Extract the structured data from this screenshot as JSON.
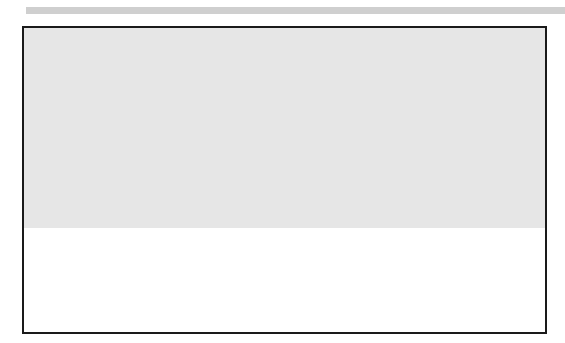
{
  "diagram": {
    "colors": {
      "background": "#ffffff",
      "top_bar": "#cfcfcf",
      "upper_fabric": "#e6e6e6",
      "lower_fabric": "#b4b4b4",
      "line": "#1a1a1a"
    },
    "frame": {
      "x": 23,
      "y": 27,
      "width": 523,
      "height": 306
    },
    "seams": [
      {
        "dashed_x": 174,
        "solid_x": 179
      },
      {
        "dashed_x": 267,
        "solid_x": 271
      },
      {
        "dashed_x": 352,
        "solid_x": 356
      }
    ],
    "panels": [
      {
        "x0": 25,
        "x1": 179,
        "edge_y0": 236,
        "edge_y1": 224,
        "hem_y": 307
      },
      {
        "x0": 179,
        "x1": 271,
        "edge_y0": 233,
        "edge_y1": 224,
        "hem_y": 304
      },
      {
        "x0": 271,
        "x1": 356,
        "edge_y0": 231,
        "edge_y1": 219,
        "hem_y": 300
      },
      {
        "x0": 356,
        "x1": 544,
        "edge_y0": 231,
        "edge_y1": 226,
        "hem_y": 304
      }
    ],
    "tick_marks": [
      {
        "x": 143,
        "y0": 251,
        "y1": 266
      },
      {
        "x": 164,
        "y0": 250,
        "y1": 264
      },
      {
        "x": 238,
        "y0": 250,
        "y1": 264
      },
      {
        "x": 257,
        "y0": 249,
        "y1": 263
      },
      {
        "x": 323,
        "y0": 247,
        "y1": 261
      },
      {
        "x": 340,
        "y0": 246,
        "y1": 260
      }
    ],
    "thread_tails": [
      {
        "x": 174,
        "y": 303
      },
      {
        "x": 268,
        "y": 300
      },
      {
        "x": 352,
        "y": 297
      }
    ]
  }
}
